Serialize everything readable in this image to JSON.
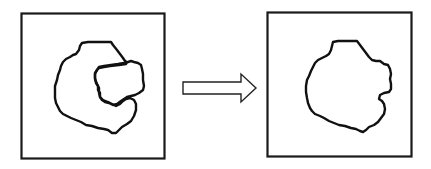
{
  "diagram": {
    "type": "before-after transformation",
    "panels": [
      {
        "id": "before",
        "description": "Irregular closed outline with a concave notch (C-shaped) and an inner lobe outline",
        "frame": {
          "x": 21,
          "y": 13,
          "width": 144,
          "height": 146
        }
      },
      {
        "id": "after",
        "description": "Single irregular closed outline with the notch filled in",
        "frame": {
          "x": 267,
          "y": 12,
          "width": 145,
          "height": 145
        }
      }
    ],
    "arrow": {
      "direction": "right",
      "style": "hollow-outline",
      "from": "before",
      "to": "after"
    },
    "colors": {
      "stroke": "#111111",
      "background": "#ffffff",
      "arrow_fill": "#ffffff"
    }
  }
}
